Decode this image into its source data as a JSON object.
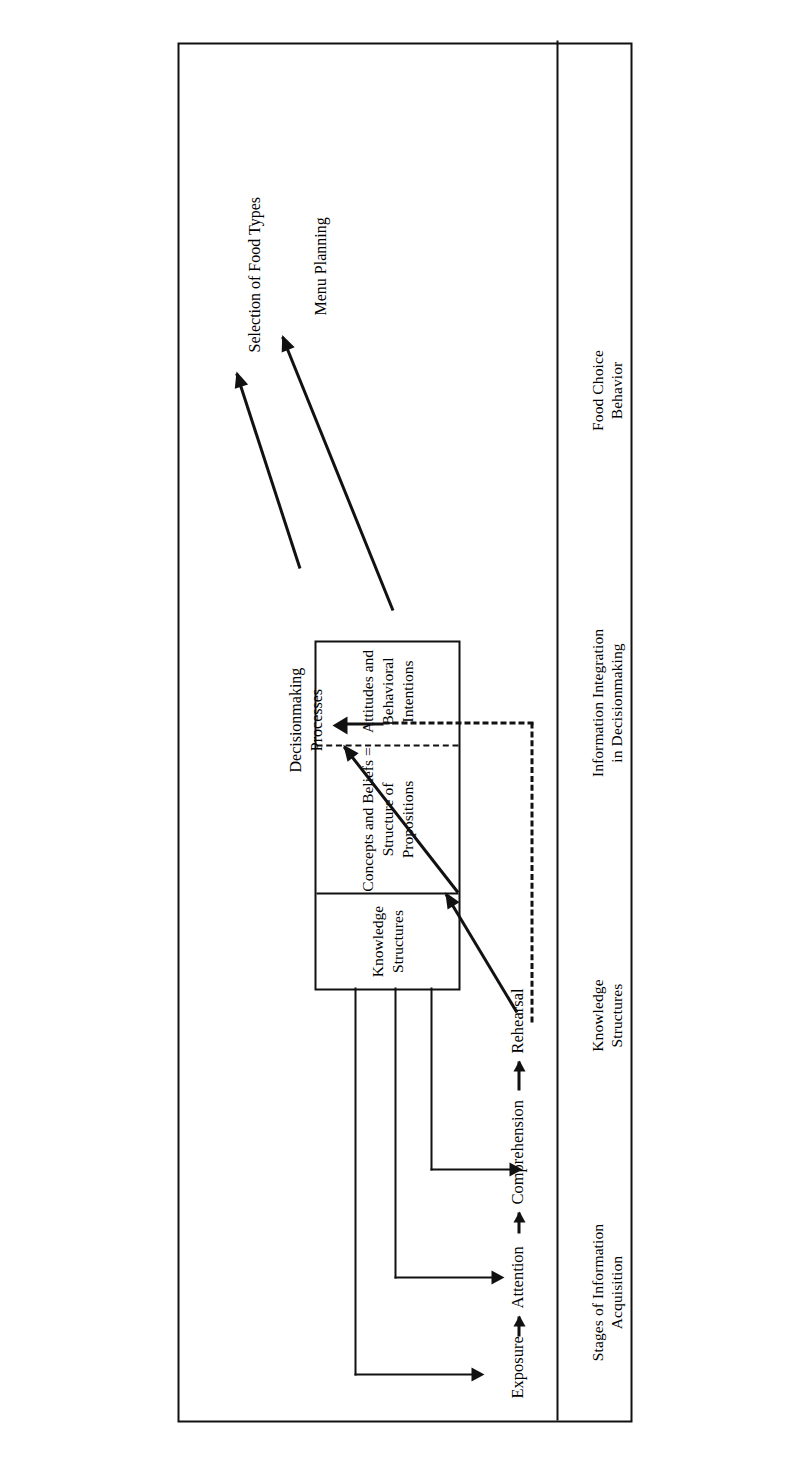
{
  "figure": {
    "orientation": "rotated-90-ccw",
    "border_color": "#111111"
  },
  "columns": [
    {
      "id": "stages",
      "line1": "Stages of Information",
      "line2": "Acquisition"
    },
    {
      "id": "knowledge",
      "line1": "Knowledge",
      "line2": "Structures"
    },
    {
      "id": "integration",
      "line1": "Information Integration",
      "line2": "in Decisionmaking"
    },
    {
      "id": "behavior",
      "line1": "Food Choice",
      "line2": "Behavior"
    }
  ],
  "stages": [
    {
      "label": "Exposure"
    },
    {
      "label": "Attention"
    },
    {
      "label": "Comprehension"
    },
    {
      "label": "Rehearsal"
    }
  ],
  "knowledge_box": {
    "sections": [
      {
        "id": "structures",
        "line1": "Knowledge",
        "line2": "Structures"
      },
      {
        "id": "concepts",
        "line1": "Concepts and Beliefs =",
        "line2": "Structure of Propositions"
      },
      {
        "id": "attitudes",
        "line1": "Attitudes and",
        "line2": "Behavioral Intentions"
      }
    ],
    "divider_styles": [
      "solid",
      "dashed"
    ]
  },
  "decisionmaking": {
    "line1": "Decisionmaking",
    "line2": "Processes"
  },
  "outputs": [
    {
      "label": "Selection of Food Types"
    },
    {
      "label": "Menu Planning"
    }
  ],
  "connectors": {
    "stage_chain": "solid-arrow",
    "knowledge_to_stages": "elbow-solid-arrow",
    "rehearsal_to_knowledge": "diagonal-solid-arrow",
    "knowledge_to_decisionmaking": "diagonal-solid-arrow",
    "rehearsal_feedback_to_decisionmaking": "dashed-arrow",
    "decisionmaking_to_outputs": "diagonal-solid-arrow"
  }
}
